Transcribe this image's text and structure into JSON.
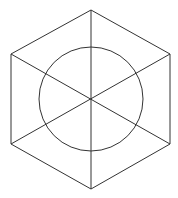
{
  "diagram": {
    "stroke_color": "#333333",
    "background": "#ffffff",
    "hexagon": {
      "vertices": [
        {
          "name": "top",
          "x": 91,
          "y": 10
        },
        {
          "name": "upper-right",
          "x": 170,
          "y": 54
        },
        {
          "name": "lower-right",
          "x": 170,
          "y": 144
        },
        {
          "name": "bottom",
          "x": 91,
          "y": 189
        },
        {
          "name": "lower-left",
          "x": 11,
          "y": 144
        },
        {
          "name": "upper-left",
          "x": 11,
          "y": 54
        }
      ]
    },
    "diagonals": [
      {
        "from": "top",
        "to": "bottom"
      },
      {
        "from": "upper-left",
        "to": "lower-right"
      },
      {
        "from": "upper-right",
        "to": "lower-left"
      }
    ],
    "circle": {
      "cx": 91,
      "cy": 99,
      "r": 52
    },
    "center": {
      "x": 91,
      "y": 99
    }
  }
}
